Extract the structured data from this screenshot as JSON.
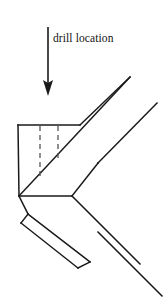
{
  "figure": {
    "background_color": "#ffffff",
    "line_color": "#1a1a1a",
    "hidden_line_color": "#555555",
    "width": 166,
    "height": 306
  },
  "annotation": {
    "label": "drill location",
    "label_x": 53,
    "label_y": 42,
    "arrow": {
      "name": "drill-location-arrow",
      "x": 48,
      "y_start": 27,
      "y_end": 95,
      "head_width": 10,
      "head_length": 13
    }
  },
  "geometry": {
    "block_top_edge": "M 18 125 L 80 125",
    "block_left_edge": "M 18 125 L 19 196",
    "block_diagonal_face": "M 19 196 L 130 77",
    "upper_rail_outer": "M 80 125 L 130 77",
    "second_rail": "M 98 163 L 157 103",
    "corner_vertex_horizontal": "M 19 196 L 72 196",
    "lower_rail_inner": "M 72 196 L 98 163",
    "lower_arm_outer": "M 72 196 L 140 264",
    "lower_arm_second": "M 98 232 L 162 296",
    "strip_shoulder": "M 19 196 L 28 214",
    "strip_top_edge": "M 28 214 L 90 262",
    "strip_left_edge": "M 28 214 L 22 222",
    "strip_bottom_edge": "M 22 222 L 78 268",
    "strip_end_cap": "M 78 268 L 90 262"
  },
  "hidden_lines": [
    {
      "name": "drill-hole-1",
      "x": 40,
      "y_start": 126,
      "y_end": 178
    },
    {
      "name": "drill-hole-2",
      "x": 58,
      "y_start": 126,
      "y_end": 160
    }
  ]
}
